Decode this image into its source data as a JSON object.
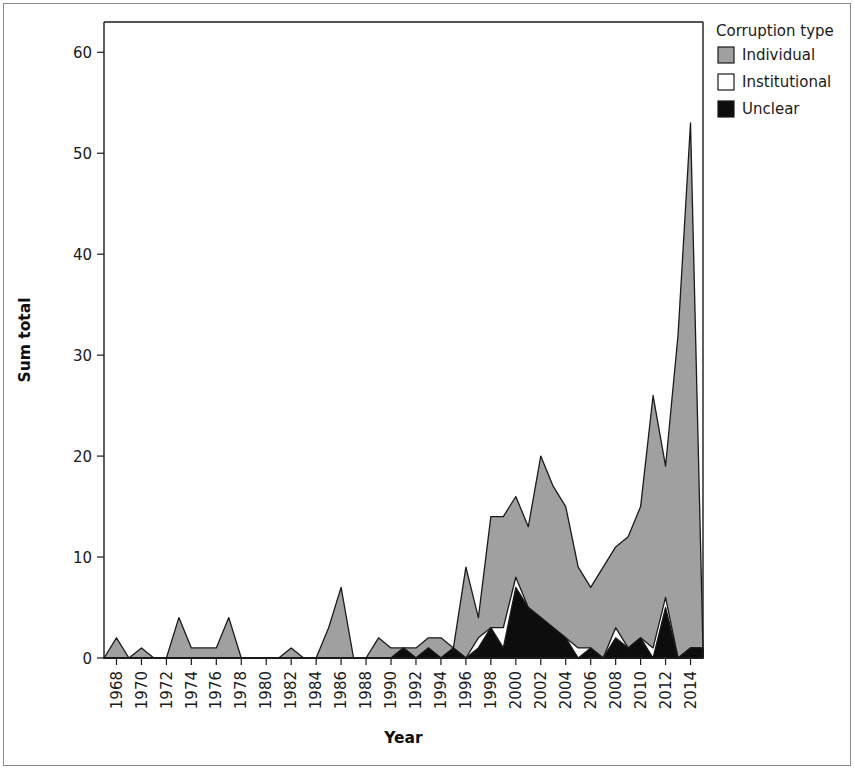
{
  "chart_data": {
    "type": "area",
    "stacked": true,
    "title": "",
    "xlabel": "Year",
    "ylabel": "Sum total",
    "xlim": [
      1967,
      2015
    ],
    "ylim": [
      0,
      63
    ],
    "ytick_values": [
      0,
      10,
      20,
      30,
      40,
      50,
      60
    ],
    "ytick_labels": [
      "0",
      "10",
      "20",
      "30",
      "40",
      "50",
      "60"
    ],
    "xtick_values": [
      1968,
      1970,
      1972,
      1974,
      1976,
      1978,
      1980,
      1982,
      1984,
      1986,
      1988,
      1990,
      1992,
      1994,
      1996,
      1998,
      2000,
      2002,
      2004,
      2006,
      2008,
      2010,
      2012,
      2014
    ],
    "xtick_labels": [
      "1968",
      "1970",
      "1972",
      "1974",
      "1976",
      "1978",
      "1980",
      "1982",
      "1984",
      "1986",
      "1988",
      "1990",
      "1992",
      "1994",
      "1996",
      "1998",
      "2000",
      "2002",
      "2004",
      "2006",
      "2008",
      "2010",
      "2012",
      "2014"
    ],
    "grid": false,
    "legend_position": "right-top",
    "legend_title": "Corruption type",
    "x": [
      1967,
      1968,
      1969,
      1970,
      1971,
      1972,
      1973,
      1974,
      1975,
      1976,
      1977,
      1978,
      1979,
      1980,
      1981,
      1982,
      1983,
      1984,
      1985,
      1986,
      1987,
      1988,
      1989,
      1990,
      1991,
      1992,
      1993,
      1994,
      1995,
      1996,
      1997,
      1998,
      1999,
      2000,
      2001,
      2002,
      2003,
      2004,
      2005,
      2006,
      2007,
      2008,
      2009,
      2010,
      2011,
      2012,
      2013,
      2014,
      2015
    ],
    "series": [
      {
        "name": "Unclear",
        "color": "#0d0d0d",
        "values": [
          0,
          0,
          0,
          0,
          0,
          0,
          0,
          0,
          0,
          0,
          0,
          0,
          0,
          0,
          0,
          0,
          0,
          0,
          0,
          0,
          0,
          0,
          0,
          0,
          1,
          0,
          1,
          0,
          1,
          0,
          1,
          3,
          1,
          7,
          5,
          4,
          3,
          2,
          0,
          1,
          0,
          2,
          1,
          2,
          0,
          5,
          0,
          1,
          1
        ]
      },
      {
        "name": "Institutional",
        "color": "#ffffff",
        "values": [
          0,
          0,
          0,
          0,
          0,
          0,
          0,
          0,
          0,
          0,
          0,
          0,
          0,
          0,
          0,
          0,
          0,
          0,
          0,
          0,
          0,
          0,
          0,
          0,
          0,
          0,
          0,
          0,
          0,
          0,
          1,
          0,
          2,
          1,
          0,
          0,
          0,
          0,
          1,
          0,
          0,
          1,
          0,
          0,
          1,
          1,
          0,
          0,
          0
        ]
      },
      {
        "name": "Individual",
        "color": "#a0a0a0",
        "values": [
          0,
          2,
          0,
          1,
          0,
          0,
          4,
          1,
          1,
          1,
          4,
          0,
          0,
          0,
          0,
          1,
          0,
          0,
          3,
          7,
          0,
          0,
          2,
          1,
          0,
          1,
          1,
          2,
          0,
          9,
          2,
          11,
          11,
          8,
          8,
          16,
          14,
          13,
          8,
          6,
          9,
          8,
          11,
          13,
          25,
          13,
          32,
          52,
          0
        ]
      }
    ],
    "total_values": [
      0,
      2,
      0,
      1,
      0,
      0,
      4,
      1,
      1,
      1,
      4,
      0,
      0,
      0,
      0,
      1,
      0,
      0,
      3,
      7,
      0,
      0,
      2,
      1,
      1,
      1,
      2,
      2,
      1,
      9,
      4,
      14,
      14,
      16,
      13,
      20,
      17,
      15,
      9,
      7,
      9,
      11,
      12,
      15,
      26,
      19,
      32,
      53,
      1
    ],
    "legend_entries": [
      {
        "label": "Individual",
        "color": "#a0a0a0"
      },
      {
        "label": "Institutional",
        "color": "#ffffff"
      },
      {
        "label": "Unclear",
        "color": "#0d0d0d"
      }
    ]
  }
}
